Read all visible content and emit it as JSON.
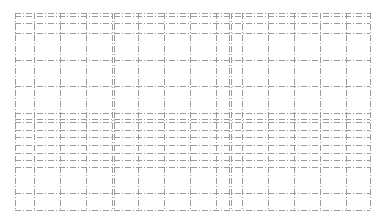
{
  "canvas": {
    "width": 384,
    "height": 222,
    "background": "#ffffff"
  },
  "grid": {
    "line_color": "#9a9a9a",
    "line_style": "dash-dot",
    "x_min": 15,
    "x_max": 370,
    "y_min": 13,
    "y_max": 210,
    "horizontal_lines": [
      13,
      16,
      23,
      33,
      60,
      86,
      113,
      119,
      122,
      130,
      137,
      145,
      153,
      160,
      167,
      193,
      210
    ],
    "vertical_lines": [
      15,
      34,
      60,
      86,
      112,
      114,
      138,
      164,
      190,
      216,
      229,
      231,
      242,
      268,
      294,
      320,
      346,
      370
    ]
  }
}
